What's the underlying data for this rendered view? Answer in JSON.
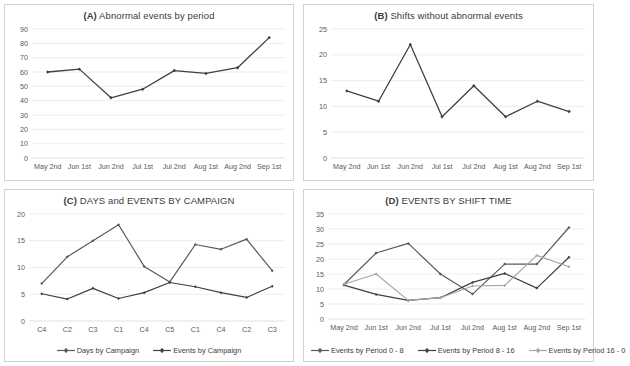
{
  "figure": {
    "background": "#ffffff",
    "panel_border": "#d2d2d2",
    "gridline_color": "#e8e8e8",
    "axis_text_color": "#595959",
    "series_dark": "#404040",
    "series_mid": "#595959",
    "series_light": "#a6a6a6"
  },
  "chart_data": [
    {
      "panel": "A",
      "type": "line",
      "title": "(A) Abnormal events by period",
      "title_prefix": "(A)",
      "title_text": "Abnormal events by period",
      "xlabel": "",
      "ylabel": "",
      "categories": [
        "May 2nd",
        "Jun 1st",
        "Jun 2nd",
        "Jul 1st",
        "Jul 2nd",
        "Aug 1st",
        "Aug 2nd",
        "Sep 1st"
      ],
      "values": [
        60,
        62,
        42,
        48,
        61,
        59,
        63,
        84
      ],
      "ylim": [
        0,
        90
      ],
      "yticks": [
        0,
        10,
        20,
        30,
        40,
        50,
        60,
        70,
        80,
        90
      ],
      "grid": true,
      "legend": false,
      "series": [
        {
          "name": "Abnormal events",
          "color": "#404040",
          "marker": "diamond",
          "values": [
            60,
            62,
            42,
            48,
            61,
            59,
            63,
            84
          ]
        }
      ]
    },
    {
      "panel": "B",
      "type": "line",
      "title": "(B) Shifts without abnormal events",
      "title_prefix": "(B)",
      "title_text": "Shifts without abnormal events",
      "xlabel": "",
      "ylabel": "",
      "categories": [
        "May 2nd",
        "Jun 1st",
        "Jun 2nd",
        "Jul 1st",
        "Jul 2nd",
        "Aug 1st",
        "Aug 2nd",
        "Sep 1st"
      ],
      "values": [
        13,
        11,
        22,
        8,
        14,
        8,
        11,
        9
      ],
      "ylim": [
        0,
        25
      ],
      "yticks": [
        0,
        5,
        10,
        15,
        20,
        25
      ],
      "grid": true,
      "legend": false,
      "series": [
        {
          "name": "Shifts without abnormal events",
          "color": "#404040",
          "marker": "diamond",
          "values": [
            13,
            11,
            22,
            8,
            14,
            8,
            11,
            9
          ]
        }
      ]
    },
    {
      "panel": "C",
      "type": "line",
      "title": "(C) DAYS and EVENTS BY CAMPAIGN",
      "title_prefix": "(C)",
      "title_text": "DAYS and EVENTS BY CAMPAIGN",
      "xlabel": "",
      "ylabel": "",
      "categories": [
        "C4",
        "C2",
        "C3",
        "C1",
        "C4",
        "C5",
        "C1",
        "C4",
        "C2",
        "C3"
      ],
      "ylim": [
        0,
        20
      ],
      "yticks": [
        0,
        5,
        10,
        15,
        20
      ],
      "grid": true,
      "legend": true,
      "legend_position": "bottom",
      "series": [
        {
          "name": "Days by Campaign",
          "color": "#595959",
          "marker": "diamond",
          "values": [
            7,
            12,
            15,
            18,
            10.2,
            7.3,
            14.3,
            13.4,
            15.3,
            9.4
          ]
        },
        {
          "name": "Events by Campaign",
          "color": "#404040",
          "marker": "diamond",
          "values": [
            5.1,
            4.1,
            6.1,
            4.2,
            5.3,
            7.2,
            6.4,
            5.3,
            4.4,
            6.5
          ]
        }
      ]
    },
    {
      "panel": "D",
      "type": "line",
      "title": "(D) EVENTS BY SHIFT TIME",
      "title_prefix": "(D)",
      "title_text": "EVENTS BY SHIFT TIME",
      "xlabel": "",
      "ylabel": "",
      "categories": [
        "May 2nd",
        "Jun 1st",
        "Jun 2nd",
        "Jul 1st",
        "Jul 2nd",
        "Aug 1st",
        "Aug 2nd",
        "Sep 1st"
      ],
      "ylim": [
        0,
        35
      ],
      "yticks": [
        0,
        5,
        10,
        15,
        20,
        25,
        30,
        35
      ],
      "grid": true,
      "legend": true,
      "legend_position": "bottom",
      "series": [
        {
          "name": "Events by Period 0 - 8",
          "color": "#595959",
          "marker": "diamond",
          "values": [
            11.5,
            22,
            25.2,
            15,
            8.3,
            18.3,
            18.3,
            30.5
          ]
        },
        {
          "name": "Events by Period 8 - 16",
          "color": "#404040",
          "marker": "diamond",
          "values": [
            11.3,
            8.2,
            6.2,
            7.1,
            12.2,
            15.2,
            10.3,
            20.6
          ]
        },
        {
          "name": "Events by Period 16 - 0",
          "color": "#a6a6a6",
          "marker": "diamond",
          "values": [
            11.6,
            15,
            6.2,
            7.1,
            11,
            11.2,
            21.2,
            17.4
          ]
        }
      ]
    }
  ]
}
